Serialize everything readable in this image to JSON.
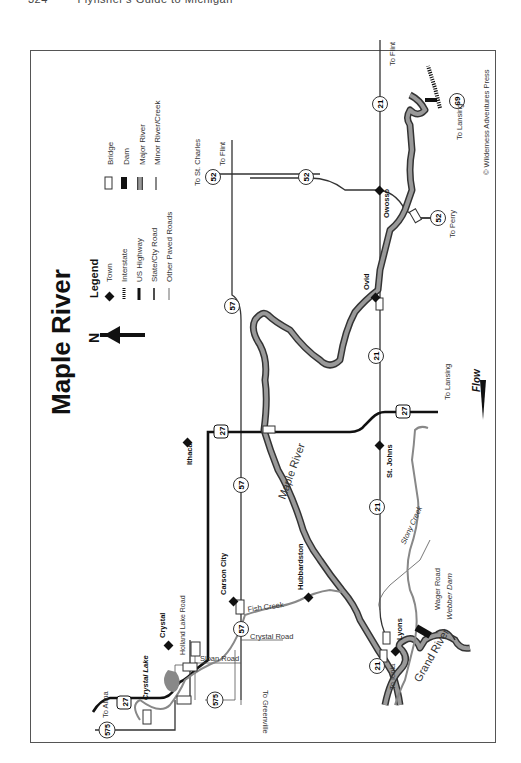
{
  "page_header": {
    "page_number": "324",
    "book_title": "Flyfisher's Guide to Michigan"
  },
  "map": {
    "title": "Maple River",
    "north_label": "N",
    "flow_label": "Flow",
    "copyright": "© Wilderness Adventures Press",
    "legend": {
      "title": "Legend",
      "items": [
        {
          "icon": "town-diamond-icon",
          "label": "Town"
        },
        {
          "icon": "interstate-hatched-line-icon",
          "label": "Interstate"
        },
        {
          "icon": "us-highway-thick-line-icon",
          "label": "US Highway"
        },
        {
          "icon": "state-road-line-icon",
          "label": "State/Cty Road"
        },
        {
          "icon": "paved-road-thin-line-icon",
          "label": "Other Paved Roads"
        },
        {
          "icon": "bridge-rect-icon",
          "label": "Bridge"
        },
        {
          "icon": "dam-block-icon",
          "label": "Dam"
        },
        {
          "icon": "major-river-icon",
          "label": "Major River"
        },
        {
          "icon": "minor-river-icon",
          "label": "Minor River/Creek"
        }
      ]
    },
    "towns": {
      "ithaca": "Ithaca",
      "st_johns": "St. Johns",
      "ovid": "Ovid",
      "owosso": "Owosso",
      "carson_city": "Carson City",
      "crystal": "Crystal",
      "hubbardston": "Hubbardston",
      "lyons": "Lyons"
    },
    "water": {
      "maple_river": "Maple River",
      "grand_river": "Grand River",
      "fish_creek": "Fish Creek",
      "stony_creek": "Stony Creek",
      "crystal_lake": "Crystal Lake",
      "webber_dam": "Webber Dam"
    },
    "roads": {
      "holland_lake_road": "Holland Lake Road",
      "sloan_road": "Sloan Road",
      "crystal_road": "Crystal Road",
      "wager_road": "Wager Road"
    },
    "shields": {
      "us27_a": "27",
      "us27_b": "27",
      "us27_c": "27",
      "m57_a": "57",
      "m57_b": "57",
      "m57_c": "57",
      "m21_a": "21",
      "m21_b": "21",
      "m21_c": "21",
      "m21_d": "21",
      "m52_a": "52",
      "m52_b": "52",
      "m52_c": "52",
      "i69": "69",
      "m575_a": "575",
      "m575_b": "575"
    },
    "destinations": {
      "alma": "To Alma",
      "st_charles": "To St. Charles",
      "flint_a": "To Flint",
      "flint_b": "To Flint",
      "lansing_a": "To Lansing",
      "lansing_b": "To Lansing",
      "perry": "To Perry",
      "ionia": "To Ionia",
      "greenville": "To Greenville"
    }
  }
}
